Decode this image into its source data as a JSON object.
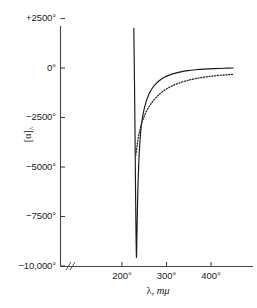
{
  "chart_data": {
    "type": "line",
    "title": "",
    "xlabel": "λ, mμ",
    "ylabel": "[α]λ",
    "ylabel_base": "[α]",
    "ylabel_sub": "λ",
    "xlabel_symbol": "λ",
    "xlabel_unit": "mμ",
    "xlim": [
      170,
      450
    ],
    "ylim": [
      -10000,
      2500
    ],
    "grid": false,
    "legend": null,
    "axis_break": "//",
    "axis_break_note": "x-axis break between origin and first tick",
    "xticks": [
      200,
      300,
      400
    ],
    "xtick_labels": [
      "200°",
      "300°",
      "400°"
    ],
    "yticks": [
      2500,
      0,
      -2500,
      -5000,
      -7500,
      -10000
    ],
    "ytick_labels": [
      "+2500°",
      "0°",
      "−2500°",
      "−5000°",
      "−7500°",
      "−10,000°"
    ],
    "series": [
      {
        "name": "solid-curve",
        "style": "solid",
        "color": "#1a1a1a",
        "points": [
          [
            226.5,
            2000
          ],
          [
            227.0,
            1200
          ],
          [
            227.5,
            300
          ],
          [
            228.0,
            -600
          ],
          [
            228.5,
            -1600
          ],
          [
            229.0,
            -2700
          ],
          [
            229.5,
            -3900
          ],
          [
            230.0,
            -5100
          ],
          [
            230.5,
            -6300
          ],
          [
            231.0,
            -7400
          ],
          [
            231.5,
            -8400
          ],
          [
            232.0,
            -9150
          ],
          [
            232.4,
            -9550
          ],
          [
            232.8,
            -9400
          ],
          [
            233.3,
            -8800
          ],
          [
            234.0,
            -7900
          ],
          [
            235.0,
            -6800
          ],
          [
            236.0,
            -5900
          ],
          [
            237.5,
            -4900
          ],
          [
            239.0,
            -4200
          ],
          [
            241.0,
            -3500
          ],
          [
            243.0,
            -3000
          ],
          [
            246.0,
            -2500
          ],
          [
            250.0,
            -2050
          ],
          [
            255.0,
            -1650
          ],
          [
            261.0,
            -1300
          ],
          [
            268.0,
            -1020
          ],
          [
            276.0,
            -800
          ],
          [
            285.0,
            -620
          ],
          [
            295.0,
            -470
          ],
          [
            306.0,
            -360
          ],
          [
            318.0,
            -270
          ],
          [
            332.0,
            -195
          ],
          [
            348.0,
            -135
          ],
          [
            365.0,
            -90
          ],
          [
            385.0,
            -55
          ],
          [
            408.0,
            -30
          ],
          [
            430.0,
            -12
          ],
          [
            450.0,
            0
          ]
        ]
      },
      {
        "name": "dotted-curve",
        "style": "dotted",
        "color": "#2a2a2a",
        "points": [
          [
            231.0,
            -4400
          ],
          [
            232.5,
            -4150
          ],
          [
            234.0,
            -3900
          ],
          [
            236.0,
            -3600
          ],
          [
            238.0,
            -3350
          ],
          [
            240.5,
            -3100
          ],
          [
            243.0,
            -2880
          ],
          [
            246.0,
            -2670
          ],
          [
            249.5,
            -2460
          ],
          [
            253.0,
            -2280
          ],
          [
            257.0,
            -2100
          ],
          [
            261.5,
            -1930
          ],
          [
            266.0,
            -1780
          ],
          [
            271.0,
            -1630
          ],
          [
            276.5,
            -1490
          ],
          [
            282.0,
            -1370
          ],
          [
            288.0,
            -1250
          ],
          [
            295.0,
            -1130
          ],
          [
            302.0,
            -1030
          ],
          [
            310.0,
            -930
          ],
          [
            318.0,
            -850
          ],
          [
            327.0,
            -770
          ],
          [
            336.0,
            -700
          ],
          [
            346.0,
            -635
          ],
          [
            356.0,
            -580
          ],
          [
            367.0,
            -530
          ],
          [
            378.0,
            -485
          ],
          [
            390.0,
            -445
          ],
          [
            402.0,
            -410
          ],
          [
            415.0,
            -380
          ],
          [
            428.0,
            -355
          ],
          [
            440.0,
            -335
          ],
          [
            450.0,
            -320
          ]
        ]
      }
    ]
  },
  "axes": {
    "y_axis_name": "y-axis",
    "x_axis_name": "x-axis"
  }
}
